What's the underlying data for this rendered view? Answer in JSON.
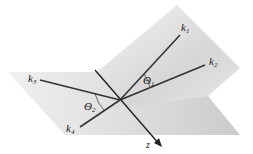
{
  "diagram": {
    "type": "two-plane wave-vector scattering geometry",
    "vectors": [
      {
        "id": "k1",
        "label": "k",
        "sub": "1"
      },
      {
        "id": "k2",
        "label": "k",
        "sub": "2"
      },
      {
        "id": "k3",
        "label": "k",
        "sub": "3"
      },
      {
        "id": "k4",
        "label": "k",
        "sub": "4"
      }
    ],
    "angles": [
      {
        "id": "theta1",
        "label": "Θ",
        "sub": "1"
      },
      {
        "id": "theta2",
        "label": "Θ",
        "sub": "2"
      }
    ],
    "axis": {
      "label": "z"
    },
    "colors": {
      "plane_light": "#f4f4f4",
      "plane_dark": "#cfcfcf",
      "line": "#333333"
    }
  }
}
